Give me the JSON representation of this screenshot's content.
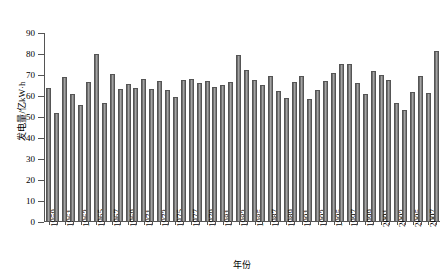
{
  "chart_data": {
    "type": "bar",
    "title": "",
    "xlabel": "年份",
    "ylabel": "发电量/亿kW·h",
    "ylim": [
      0,
      90
    ],
    "yticks": [
      0,
      10,
      20,
      30,
      40,
      50,
      60,
      70,
      80,
      90
    ],
    "grid": false,
    "legend": null,
    "tick_label_interval": 2,
    "categories": [
      "1959",
      "1960",
      "1961",
      "1962",
      "1963",
      "1964",
      "1965",
      "1966",
      "1967",
      "1968",
      "1969",
      "1970",
      "1971",
      "1972",
      "1973",
      "1974",
      "1975",
      "1976",
      "1977",
      "1978",
      "1979",
      "1980",
      "1981",
      "1982",
      "1983",
      "1984",
      "1985",
      "1986",
      "1987",
      "1988",
      "1989",
      "1990",
      "1991",
      "1992",
      "1993",
      "1994",
      "1995",
      "1996",
      "1997",
      "1998",
      "1999",
      "2000",
      "2001",
      "2002",
      "2003",
      "2004",
      "2005",
      "2006",
      "2007",
      "2008"
    ],
    "values": [
      63.2,
      51.6,
      68.7,
      60.6,
      55.4,
      66.2,
      79.5,
      56.4,
      69.8,
      62.8,
      65.3,
      63.3,
      67.6,
      63.0,
      66.5,
      62.4,
      59.0,
      67.3,
      67.5,
      65.8,
      66.5,
      64.0,
      64.7,
      66.2,
      79.0,
      72.0,
      67.3,
      65.0,
      69.0,
      62.0,
      58.7,
      66.3,
      69.0,
      58.0,
      62.6,
      66.7,
      70.5,
      75.0,
      74.8,
      65.5,
      60.3,
      71.5,
      69.6,
      67.0,
      56.0,
      52.9,
      61.5,
      68.9,
      61.0,
      81.0
    ]
  }
}
